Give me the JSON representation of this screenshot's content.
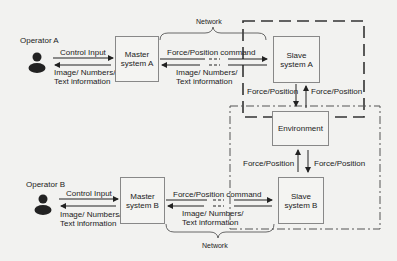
{
  "operators": {
    "a": {
      "label": "Operator A"
    },
    "b": {
      "label": "Operator B"
    }
  },
  "boxes": {
    "master_a": {
      "line1": "Master",
      "line2": "system A"
    },
    "slave_a": {
      "line1": "Slave",
      "line2": "system A"
    },
    "environment": {
      "label": "Environment"
    },
    "master_b": {
      "line1": "Master",
      "line2": "system B"
    },
    "slave_b": {
      "line1": "Slave",
      "line2": "system B"
    }
  },
  "arrows": {
    "control_input_a": "Control Input",
    "feedback_a_1": "Image/ Numbers/",
    "feedback_a_2": "Text information",
    "command_a": "Force/Position command",
    "net_feedback_a_1": "Image/ Numbers/",
    "net_feedback_a_2": "Text information",
    "slave_a_to_env": "Force/Position",
    "env_to_slave_a": "Force/Position",
    "env_to_slave_b": "Force/Position",
    "slave_b_to_env": "Force/Position",
    "control_input_b": "Control Input",
    "feedback_b_1": "Image/ Numbers/",
    "feedback_b_2": "Text information",
    "command_b": "Force/Position command",
    "net_feedback_b_1": "Image/ Numbers/",
    "net_feedback_b_2": "Text information"
  },
  "network": {
    "top_label": "Network",
    "bottom_label": "Network"
  },
  "colors": {
    "line": "#333333",
    "box_border": "#888888",
    "background": "#f2f2f0"
  }
}
